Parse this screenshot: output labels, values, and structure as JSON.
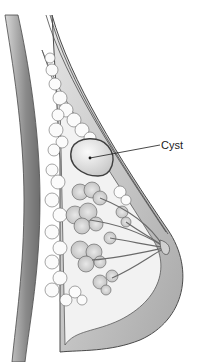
{
  "figure": {
    "labels": [
      {
        "id": "cyst",
        "text": "Cyst",
        "x": 163,
        "y": 147
      }
    ]
  },
  "colors": {
    "background": "#ffffff",
    "outline": "#4a4a4a",
    "chest_wall": "#8c8c8c",
    "skin_band": "#b5b5b5",
    "fat_lobules": "#f4f4f4",
    "glandular": "#d9d9d9",
    "cyst_fill": "#e6e6e6"
  }
}
